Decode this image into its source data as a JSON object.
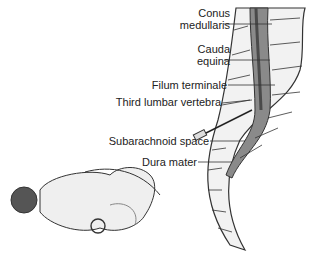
{
  "labels": {
    "conus_1": "Conus",
    "conus_2": "medullaris",
    "cauda_1": "Cauda",
    "cauda_2": "equina",
    "filum": "Filum terminale",
    "third_lumbar": "Third lumbar vertebra",
    "subarachnoid": "Subarachnoid space",
    "dura": "Dura mater"
  },
  "colors": {
    "bone": "#f2f2f2",
    "canal": "#8a8a8a",
    "dark": "#5a5a5a",
    "outline": "#333333"
  }
}
